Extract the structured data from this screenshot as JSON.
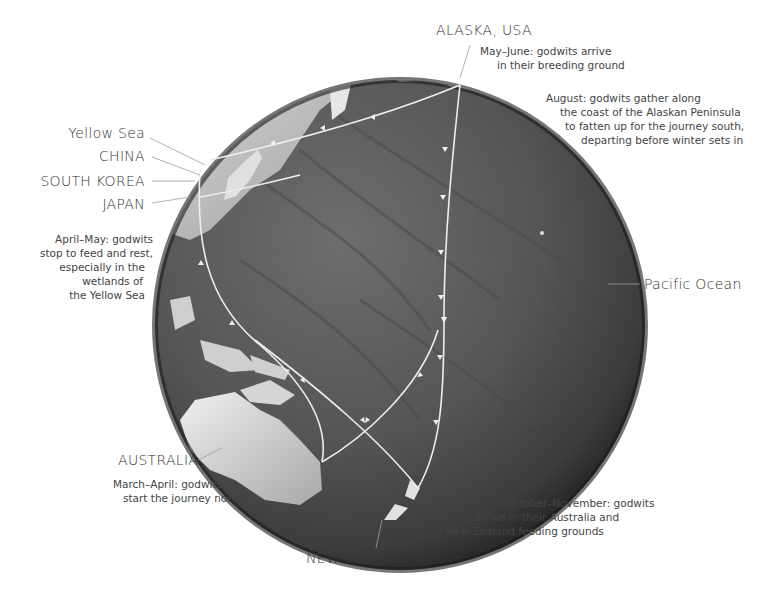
{
  "map": {
    "title": "Bar-tailed godwit migration across the Pacific",
    "places": {
      "alaska": "ALASKA, USA",
      "yellow_sea": "Yellow Sea",
      "china": "CHINA",
      "south_korea": "SOUTH KOREA",
      "japan": "JAPAN",
      "pacific": "Pacific Ocean",
      "australia": "AUSTRALIA",
      "new_zealand": "NEW ZEALAND"
    },
    "notes": {
      "may_june": [
        "May–June: godwits arrive",
        "in their breeding ground"
      ],
      "august": [
        "August: godwits gather along",
        "the coast of the Alaskan Peninsula",
        "to fatten up for the journey south,",
        "departing before winter sets in"
      ],
      "april_may": [
        "April–May: godwits",
        "stop to feed and rest,",
        "especially in the",
        "wetlands of",
        "the Yellow Sea"
      ],
      "march_april": [
        "March–April: godwits",
        "start the journey north"
      ],
      "oct_nov": [
        "October–November: godwits",
        "arrive in their Australia and",
        "New Zealand feeding grounds"
      ]
    },
    "colors": {
      "ocean": "#5a5a5a",
      "ocean_dark": "#2e2e2e",
      "land": "#d8d8d8",
      "route": "#eeeeee",
      "leader": "#9a9a9a",
      "text": "#333333"
    }
  }
}
